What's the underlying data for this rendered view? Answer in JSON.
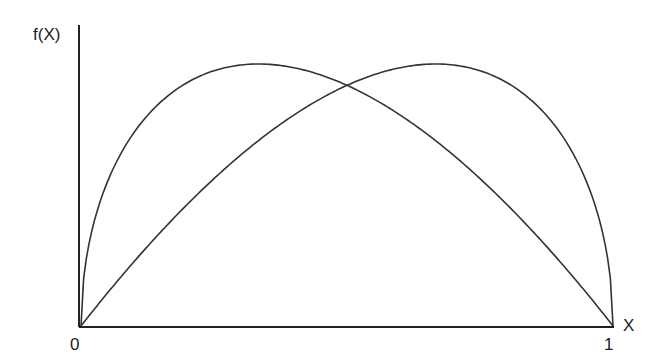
{
  "chart_data": {
    "type": "line",
    "title": "",
    "xlabel": "X",
    "ylabel": "f(X)",
    "xlim": [
      0,
      1
    ],
    "x_tick_labels": [
      "0",
      "1"
    ],
    "y_tick_labels": [],
    "grid": false,
    "legend": null,
    "series": [
      {
        "name": "left-skewed density",
        "shape": "beta",
        "alpha": 1.5,
        "beta": 2.0,
        "mode_x": 0.34,
        "peak_relative_height": 1.0
      },
      {
        "name": "right-skewed density",
        "shape": "beta",
        "alpha": 2.0,
        "beta": 1.5,
        "mode_x": 0.66,
        "peak_relative_height": 1.0
      }
    ],
    "intersection": {
      "x": 0.49,
      "relative_height": 0.79
    },
    "line_color": "#333333"
  },
  "labels": {
    "y_axis": "f(X)",
    "x_axis": "X",
    "x_min": "0",
    "x_max": "1"
  }
}
